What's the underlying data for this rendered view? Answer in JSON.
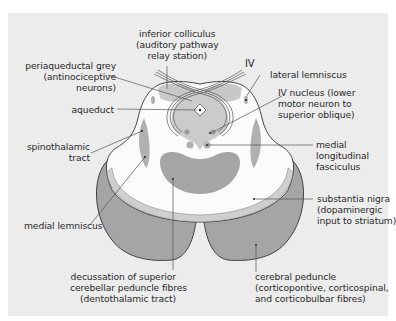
{
  "figure": {
    "colors": {
      "panel_bg": "#ececec",
      "tissue_white": "#fbfbfb",
      "grey_matter": "#a5a5a5",
      "light_grey_band": "#cfcfcf",
      "outline": "#333333",
      "leader_line": "#555555"
    },
    "labels": {
      "inferior_colliculus": "inferior colliculus\n(auditory pathway\nrelay station)",
      "iv_nerve": "IV",
      "periaqueductal_grey": "periaqueductal grey\n(antinociceptive\nneurons)",
      "aqueduct": "aqueduct",
      "lateral_lemniscus": "lateral lemniscus",
      "iv_nucleus": "IV nucleus (lower\nmotor neuron to\nsuperior oblique)",
      "spinothalamic_tract": "spinothalamic\ntract",
      "medial_longitudinal_fasciculus": "medial\nlongitudinal\nfasciculus",
      "medial_lemniscus": "medial lemniscus",
      "substantia_nigra": "substantia nigra\n(dopaminergic\ninput to striatum)",
      "decussation": "decussation of superior\ncerebellar peduncle fibres\n(dentothalamic tract)",
      "cerebral_peduncle": "cerebral peduncle\n(corticopontive, corticospinal,\nand corticobulbar fibres)"
    }
  }
}
